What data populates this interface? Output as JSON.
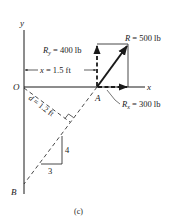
{
  "diagram": {
    "caption": "(c)",
    "axes": {
      "x_label": "x",
      "y_label": "y",
      "origin_label": "O"
    },
    "points": {
      "A": "A",
      "B": "B"
    },
    "forces": {
      "R": {
        "symbol": "R",
        "rest": " = 500 lb"
      },
      "Ry": {
        "symbol": "R",
        "sub": "y",
        "rest": " = 400 lb"
      },
      "Rx": {
        "symbol": "R",
        "sub": "x",
        "rest": " = 300 lb"
      }
    },
    "dimensions": {
      "x_dist": {
        "symbol": "x",
        "rest": " = 1.5 ft"
      },
      "d_dist": {
        "symbol": "d",
        "rest": " = 1.2 ft"
      }
    },
    "slope": {
      "rise": "4",
      "run": "3"
    },
    "colors": {
      "line": "#1a1a1a",
      "background": "#ffffff"
    }
  }
}
